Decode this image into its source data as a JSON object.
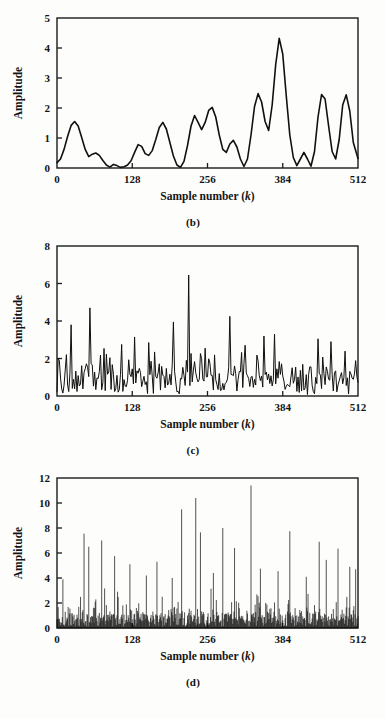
{
  "figure": {
    "background_color": "#fdfdfb",
    "ink_color": "#101010",
    "axis_label_y": "Amplitude",
    "axis_label_x_main": "Sample number (",
    "axis_label_x_ital": "k",
    "axis_label_x_close": ")"
  },
  "panels": [
    {
      "id": "panel-b",
      "caption": "(b)",
      "chart_ref": 0
    },
    {
      "id": "panel-c",
      "caption": "(c)",
      "chart_ref": 1
    },
    {
      "id": "panel-d",
      "caption": "(d)",
      "chart_ref": 2
    }
  ],
  "chart_data": [
    {
      "type": "line",
      "title": "(b)",
      "xlabel": "Sample number (k)",
      "ylabel": "Amplitude",
      "xlim": [
        0,
        512
      ],
      "ylim": [
        0,
        5
      ],
      "xticks": [
        0,
        128,
        256,
        384,
        512
      ],
      "xtick_labels": [
        "0",
        "128",
        "256",
        "384",
        "512"
      ],
      "yticks": [
        0,
        1,
        2,
        3,
        4,
        5
      ],
      "ytick_labels": [
        "0",
        "1",
        "2",
        "3",
        "4",
        "5"
      ],
      "grid": false,
      "legend": false,
      "style": "smooth-envelope",
      "x": [
        0,
        6,
        12,
        18,
        24,
        30,
        36,
        42,
        48,
        54,
        60,
        66,
        72,
        78,
        84,
        90,
        96,
        102,
        108,
        114,
        120,
        126,
        132,
        138,
        144,
        150,
        156,
        162,
        168,
        174,
        180,
        186,
        192,
        198,
        204,
        210,
        216,
        222,
        228,
        234,
        240,
        246,
        252,
        258,
        264,
        270,
        276,
        282,
        288,
        294,
        300,
        306,
        312,
        318,
        324,
        330,
        336,
        342,
        348,
        354,
        360,
        366,
        372,
        378,
        384,
        390,
        396,
        402,
        408,
        414,
        420,
        426,
        432,
        438,
        444,
        450,
        456,
        462,
        468,
        474,
        480,
        486,
        492,
        498,
        504,
        512
      ],
      "values": [
        0.18,
        0.3,
        0.62,
        1.05,
        1.42,
        1.55,
        1.4,
        1.02,
        0.62,
        0.38,
        0.46,
        0.5,
        0.42,
        0.25,
        0.1,
        0.03,
        0.12,
        0.08,
        0.02,
        0.04,
        0.1,
        0.24,
        0.52,
        0.78,
        0.72,
        0.48,
        0.42,
        0.58,
        0.95,
        1.35,
        1.52,
        1.3,
        0.85,
        0.4,
        0.1,
        0.02,
        0.22,
        0.75,
        1.4,
        1.75,
        1.52,
        1.28,
        1.52,
        1.92,
        2.02,
        1.7,
        1.1,
        0.62,
        0.52,
        0.8,
        0.92,
        0.7,
        0.3,
        0.05,
        0.3,
        1.1,
        2.05,
        2.48,
        2.2,
        1.55,
        1.25,
        2.1,
        3.45,
        4.32,
        3.8,
        2.4,
        1.1,
        0.35,
        0.08,
        0.3,
        0.52,
        0.3,
        0.06,
        0.55,
        1.7,
        2.45,
        2.3,
        1.4,
        0.55,
        0.3,
        0.95,
        2.1,
        2.44,
        1.9,
        0.85,
        0.32
      ]
    },
    {
      "type": "line",
      "title": "(c)",
      "xlabel": "Sample number (k)",
      "ylabel": "Amplitude",
      "xlim": [
        0,
        512
      ],
      "ylim": [
        0,
        8
      ],
      "xticks": [
        0,
        128,
        256,
        384,
        512
      ],
      "xtick_labels": [
        "0",
        "128",
        "256",
        "384",
        "512"
      ],
      "yticks": [
        0,
        2,
        4,
        6,
        8
      ],
      "ytick_labels": [
        "0",
        "2",
        "4",
        "6",
        "8"
      ],
      "grid": false,
      "legend": false,
      "style": "noisy-line",
      "peak_max": 6.45,
      "peak_max_x": 224,
      "seed": 1771,
      "n": 256,
      "baseline": 0.9,
      "notable_peaks": [
        {
          "x": 24,
          "y": 3.8
        },
        {
          "x": 56,
          "y": 4.7
        },
        {
          "x": 110,
          "y": 2.75
        },
        {
          "x": 132,
          "y": 3.15
        },
        {
          "x": 156,
          "y": 2.85
        },
        {
          "x": 198,
          "y": 3.95
        },
        {
          "x": 224,
          "y": 6.45
        },
        {
          "x": 252,
          "y": 2.55
        },
        {
          "x": 294,
          "y": 4.25
        },
        {
          "x": 352,
          "y": 3.2
        },
        {
          "x": 370,
          "y": 3.3
        },
        {
          "x": 444,
          "y": 3.05
        },
        {
          "x": 466,
          "y": 2.9
        }
      ]
    },
    {
      "type": "line",
      "title": "(d)",
      "xlabel": "Sample number (k)",
      "ylabel": "Amplitude",
      "xlim": [
        0,
        512
      ],
      "ylim": [
        0,
        12
      ],
      "xticks": [
        0,
        128,
        256,
        384,
        512
      ],
      "xtick_labels": [
        "0",
        "128",
        "256",
        "384",
        "512"
      ],
      "yticks": [
        0,
        2,
        4,
        6,
        8,
        10,
        12
      ],
      "ytick_labels": [
        "0",
        "2",
        "4",
        "6",
        "8",
        "10",
        "12"
      ],
      "grid": false,
      "legend": false,
      "style": "dense-stems",
      "peak_max": 11.4,
      "peak_max_x": 330,
      "seed": 9042,
      "n": 512,
      "baseline": 0.7,
      "notable_peaks": [
        {
          "x": 10,
          "y": 3.9
        },
        {
          "x": 46,
          "y": 7.55
        },
        {
          "x": 54,
          "y": 6.5
        },
        {
          "x": 76,
          "y": 7.0
        },
        {
          "x": 98,
          "y": 5.75
        },
        {
          "x": 124,
          "y": 5.1
        },
        {
          "x": 152,
          "y": 4.2
        },
        {
          "x": 170,
          "y": 5.3
        },
        {
          "x": 196,
          "y": 4.0
        },
        {
          "x": 212,
          "y": 9.5
        },
        {
          "x": 236,
          "y": 10.4
        },
        {
          "x": 244,
          "y": 7.65
        },
        {
          "x": 266,
          "y": 4.4
        },
        {
          "x": 282,
          "y": 8.0
        },
        {
          "x": 302,
          "y": 6.4
        },
        {
          "x": 330,
          "y": 11.4
        },
        {
          "x": 346,
          "y": 4.75
        },
        {
          "x": 376,
          "y": 4.55
        },
        {
          "x": 396,
          "y": 7.75
        },
        {
          "x": 424,
          "y": 4.1
        },
        {
          "x": 446,
          "y": 6.9
        },
        {
          "x": 458,
          "y": 5.45
        },
        {
          "x": 478,
          "y": 6.35
        },
        {
          "x": 498,
          "y": 4.9
        },
        {
          "x": 508,
          "y": 4.7
        }
      ]
    }
  ]
}
